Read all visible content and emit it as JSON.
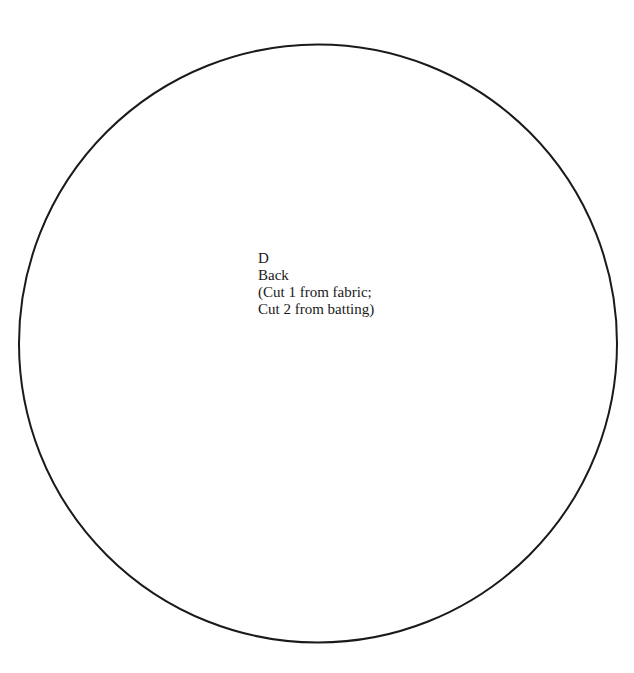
{
  "pattern_piece": {
    "letter": "D",
    "name": "Back",
    "instructions": [
      "(Cut 1 from fabric;",
      "Cut 2 from batting)"
    ],
    "shape": "circle",
    "outline_color": "#1a1a1a",
    "background_color": "#ffffff"
  }
}
